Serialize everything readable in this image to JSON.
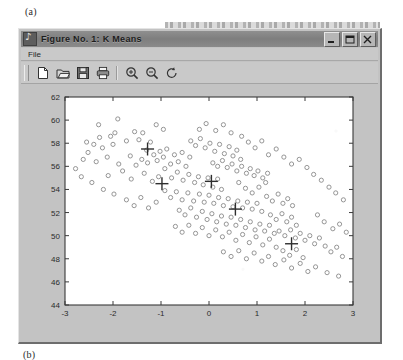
{
  "figure_label_a": "(a)",
  "figure_label_b": "(b)",
  "window": {
    "title": "Figure No. 1:  K Means",
    "app_icon": "matlab-figure-icon",
    "buttons": [
      {
        "name": "minimize",
        "glyph": "minimize-icon"
      },
      {
        "name": "maximize",
        "glyph": "maximize-icon"
      },
      {
        "name": "close",
        "glyph": "close-icon"
      }
    ]
  },
  "menu": {
    "items": [
      {
        "label": "File"
      }
    ]
  },
  "toolbar": {
    "buttons": [
      {
        "name": "new-figure",
        "icon": "new-page-icon",
        "tooltip": "New Figure"
      },
      {
        "name": "open-figure",
        "icon": "open-folder-icon",
        "tooltip": "Open"
      },
      {
        "name": "save-figure",
        "icon": "save-disk-icon",
        "tooltip": "Save"
      },
      {
        "name": "print-figure",
        "icon": "printer-icon",
        "tooltip": "Print"
      },
      {
        "name": "zoom-in",
        "icon": "zoom-in-icon",
        "tooltip": "Zoom In"
      },
      {
        "name": "zoom-out",
        "icon": "zoom-out-icon",
        "tooltip": "Zoom Out"
      },
      {
        "name": "rotate-3d",
        "icon": "rotate-icon",
        "tooltip": "Rotate 3D"
      }
    ]
  },
  "colors": {
    "window_face": "#c3c3c3",
    "title_bar": "#7e7e7e",
    "axes_background": "#ffffff",
    "axes_line": "#3a3a3a",
    "marker": "#8a8a8a",
    "centroid": "#2e2e2e"
  },
  "chart_data": {
    "type": "scatter",
    "title": "K Means",
    "xlabel": "",
    "ylabel": "",
    "xlim": [
      -3,
      3
    ],
    "ylim": [
      44,
      62
    ],
    "xticks": [
      -3,
      -2,
      -1,
      0,
      1,
      2,
      3
    ],
    "yticks": [
      44,
      46,
      48,
      50,
      52,
      54,
      56,
      58,
      60,
      62
    ],
    "grid": false,
    "legend": null,
    "tick_direction": "in",
    "marker_style": "open-circle",
    "centroid_marker_style": "plus",
    "series": [
      {
        "name": "data points",
        "marker": "o",
        "color": "#8a8a8a",
        "points": [
          [
            -2.4,
            57.9
          ],
          [
            -2.28,
            58.5
          ],
          [
            -2.22,
            57.6
          ],
          [
            -2.05,
            58.6
          ],
          [
            -2.0,
            57.9
          ],
          [
            -1.96,
            58.9
          ],
          [
            -1.72,
            58.2
          ],
          [
            -1.55,
            59.0
          ],
          [
            -1.46,
            58.3
          ],
          [
            -1.38,
            58.9
          ],
          [
            -1.3,
            57.4
          ],
          [
            -1.22,
            58.1
          ],
          [
            -2.52,
            57.2
          ],
          [
            -2.62,
            56.6
          ],
          [
            -2.35,
            56.4
          ],
          [
            -2.12,
            56.8
          ],
          [
            -1.88,
            56.2
          ],
          [
            -1.64,
            56.9
          ],
          [
            -1.52,
            56.1
          ],
          [
            -1.4,
            56.6
          ],
          [
            -1.28,
            56.3
          ],
          [
            -1.15,
            57.0
          ],
          [
            -1.08,
            56.5
          ],
          [
            -1.02,
            57.3
          ],
          [
            -0.95,
            56.8
          ],
          [
            -0.88,
            57.5
          ],
          [
            -0.8,
            56.2
          ],
          [
            -0.72,
            57.0
          ],
          [
            -0.64,
            56.4
          ],
          [
            -0.56,
            57.2
          ],
          [
            -0.48,
            56.0
          ],
          [
            -0.4,
            56.8
          ],
          [
            -2.1,
            55.2
          ],
          [
            -1.8,
            55.6
          ],
          [
            -1.62,
            54.9
          ],
          [
            -1.35,
            55.4
          ],
          [
            -1.18,
            54.7
          ],
          [
            -1.05,
            55.1
          ],
          [
            -0.92,
            55.8
          ],
          [
            -0.78,
            55.0
          ],
          [
            -0.66,
            55.5
          ],
          [
            -0.54,
            54.8
          ],
          [
            -0.42,
            55.3
          ],
          [
            -0.3,
            54.6
          ],
          [
            -0.22,
            55.1
          ],
          [
            -0.12,
            54.4
          ],
          [
            -0.02,
            55.0
          ],
          [
            0.08,
            54.2
          ],
          [
            0.18,
            54.9
          ],
          [
            0.26,
            54.0
          ],
          [
            -0.38,
            58.2
          ],
          [
            -0.28,
            57.8
          ],
          [
            -0.18,
            58.4
          ],
          [
            -0.08,
            57.6
          ],
          [
            0.02,
            58.0
          ],
          [
            0.12,
            57.3
          ],
          [
            0.22,
            57.9
          ],
          [
            0.32,
            57.1
          ],
          [
            0.42,
            57.7
          ],
          [
            0.5,
            56.9
          ],
          [
            0.58,
            57.4
          ],
          [
            0.66,
            56.6
          ],
          [
            0.08,
            56.3
          ],
          [
            0.18,
            56.0
          ],
          [
            0.28,
            56.5
          ],
          [
            0.38,
            55.9
          ],
          [
            0.48,
            56.2
          ],
          [
            0.58,
            55.6
          ],
          [
            0.68,
            56.0
          ],
          [
            0.78,
            55.4
          ],
          [
            0.86,
            55.8
          ],
          [
            0.94,
            55.2
          ],
          [
            1.02,
            55.6
          ],
          [
            1.12,
            55.0
          ],
          [
            1.22,
            55.4
          ],
          [
            -0.92,
            53.9
          ],
          [
            -0.8,
            53.3
          ],
          [
            -0.68,
            53.8
          ],
          [
            -0.56,
            53.1
          ],
          [
            -0.44,
            53.7
          ],
          [
            -0.32,
            53.0
          ],
          [
            -0.2,
            53.6
          ],
          [
            -0.1,
            52.9
          ],
          [
            0.0,
            53.5
          ],
          [
            0.1,
            52.8
          ],
          [
            0.2,
            53.3
          ],
          [
            0.3,
            52.6
          ],
          [
            0.4,
            53.2
          ],
          [
            0.5,
            52.5
          ],
          [
            0.6,
            53.0
          ],
          [
            0.7,
            52.4
          ],
          [
            0.8,
            52.9
          ],
          [
            0.9,
            52.3
          ],
          [
            1.0,
            52.8
          ],
          [
            1.1,
            52.1
          ],
          [
            -0.62,
            52.2
          ],
          [
            -0.5,
            51.8
          ],
          [
            -0.38,
            52.4
          ],
          [
            -0.26,
            51.6
          ],
          [
            -0.14,
            52.1
          ],
          [
            -0.04,
            51.4
          ],
          [
            0.06,
            51.9
          ],
          [
            0.16,
            51.2
          ],
          [
            0.26,
            51.7
          ],
          [
            0.36,
            51.0
          ],
          [
            0.46,
            51.6
          ],
          [
            0.56,
            50.9
          ],
          [
            0.66,
            51.4
          ],
          [
            0.76,
            50.7
          ],
          [
            0.86,
            51.2
          ],
          [
            0.96,
            50.5
          ],
          [
            1.06,
            51.0
          ],
          [
            1.16,
            50.4
          ],
          [
            1.26,
            50.9
          ],
          [
            1.36,
            50.2
          ],
          [
            1.2,
            53.4
          ],
          [
            1.32,
            53.0
          ],
          [
            1.44,
            53.6
          ],
          [
            1.54,
            52.8
          ],
          [
            1.64,
            53.2
          ],
          [
            1.74,
            52.6
          ],
          [
            1.28,
            51.8
          ],
          [
            1.4,
            51.4
          ],
          [
            1.52,
            51.9
          ],
          [
            1.62,
            51.2
          ],
          [
            1.72,
            51.6
          ],
          [
            1.82,
            50.9
          ],
          [
            1.46,
            50.4
          ],
          [
            1.58,
            50.0
          ],
          [
            1.7,
            50.5
          ],
          [
            1.8,
            49.8
          ],
          [
            1.9,
            50.2
          ],
          [
            2.0,
            49.6
          ],
          [
            2.1,
            50.0
          ],
          [
            2.2,
            49.3
          ],
          [
            2.3,
            49.8
          ],
          [
            2.42,
            49.1
          ],
          [
            2.54,
            48.6
          ],
          [
            2.66,
            49.0
          ],
          [
            2.78,
            48.2
          ],
          [
            -0.7,
            50.8
          ],
          [
            -0.56,
            50.3
          ],
          [
            -0.42,
            50.9
          ],
          [
            -0.28,
            50.2
          ],
          [
            -0.14,
            50.7
          ],
          [
            0.0,
            50.0
          ],
          [
            0.14,
            50.5
          ],
          [
            0.28,
            49.9
          ],
          [
            0.42,
            50.3
          ],
          [
            0.56,
            49.6
          ],
          [
            0.7,
            50.1
          ],
          [
            0.84,
            49.4
          ],
          [
            0.98,
            49.9
          ],
          [
            1.12,
            49.2
          ],
          [
            1.26,
            49.7
          ],
          [
            1.4,
            49.0
          ],
          [
            1.54,
            48.7
          ],
          [
            1.68,
            48.3
          ],
          [
            1.82,
            48.8
          ],
          [
            1.96,
            48.1
          ],
          [
            0.3,
            48.6
          ],
          [
            0.46,
            48.2
          ],
          [
            0.62,
            48.7
          ],
          [
            0.78,
            48.0
          ],
          [
            0.94,
            48.5
          ],
          [
            1.1,
            47.8
          ],
          [
            1.24,
            48.2
          ],
          [
            1.38,
            47.5
          ],
          [
            1.56,
            47.9
          ],
          [
            1.72,
            47.2
          ],
          [
            1.9,
            47.6
          ],
          [
            2.06,
            46.9
          ],
          [
            2.22,
            47.3
          ],
          [
            2.46,
            46.8
          ],
          [
            2.7,
            46.5
          ],
          [
            -1.72,
            53.1
          ],
          [
            -1.56,
            52.6
          ],
          [
            -1.42,
            53.3
          ],
          [
            -1.26,
            52.4
          ],
          [
            -1.1,
            52.9
          ],
          [
            -2.78,
            55.8
          ],
          [
            -2.66,
            55.1
          ],
          [
            -2.44,
            54.6
          ],
          [
            -2.2,
            54.0
          ],
          [
            -1.98,
            53.6
          ],
          [
            2.26,
            51.8
          ],
          [
            2.4,
            51.2
          ],
          [
            2.58,
            50.6
          ],
          [
            2.72,
            51.0
          ],
          [
            2.86,
            50.3
          ],
          [
            0.68,
            58.6
          ],
          [
            0.82,
            58.1
          ],
          [
            0.96,
            57.6
          ],
          [
            1.1,
            58.2
          ],
          [
            1.24,
            57.0
          ],
          [
            1.4,
            57.5
          ],
          [
            1.56,
            56.8
          ],
          [
            1.72,
            56.2
          ],
          [
            1.88,
            56.6
          ],
          [
            2.04,
            55.9
          ],
          [
            2.18,
            55.3
          ],
          [
            2.34,
            54.8
          ],
          [
            2.5,
            54.2
          ],
          [
            2.64,
            53.7
          ],
          [
            2.8,
            53.1
          ],
          [
            -0.2,
            59.2
          ],
          [
            -0.06,
            59.7
          ],
          [
            0.14,
            59.1
          ],
          [
            0.3,
            59.6
          ],
          [
            0.46,
            58.9
          ],
          [
            -1.1,
            59.6
          ],
          [
            -0.95,
            59.2
          ],
          [
            0.62,
            54.6
          ],
          [
            0.76,
            54.1
          ],
          [
            0.9,
            53.7
          ],
          [
            1.04,
            54.2
          ],
          [
            1.18,
            54.6
          ],
          [
            -1.9,
            60.1
          ],
          [
            -2.3,
            59.6
          ],
          [
            -2.55,
            58.1
          ]
        ]
      },
      {
        "name": "centroids",
        "marker": "+",
        "color": "#2e2e2e",
        "points": [
          [
            -1.28,
            57.5
          ],
          [
            -0.98,
            54.5
          ],
          [
            0.05,
            54.7
          ],
          [
            0.55,
            52.3
          ],
          [
            1.72,
            49.3
          ]
        ]
      }
    ]
  }
}
